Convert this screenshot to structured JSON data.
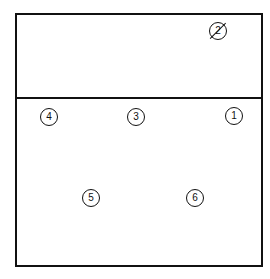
{
  "diagram": {
    "type": "volleyball-court-rotation",
    "line_color": "#111111",
    "background": "#ffffff",
    "court": {
      "left": 15,
      "top": 13,
      "right": 261,
      "bottom": 265
    },
    "divider_y": 98,
    "players": [
      {
        "id": "p1",
        "label": "1",
        "x": 234,
        "y": 116,
        "slashed": false
      },
      {
        "id": "p2",
        "label": "2",
        "x": 218,
        "y": 31,
        "slashed": true
      },
      {
        "id": "p3",
        "label": "3",
        "x": 136,
        "y": 117,
        "slashed": false
      },
      {
        "id": "p4",
        "label": "4",
        "x": 49,
        "y": 117,
        "slashed": false
      },
      {
        "id": "p5",
        "label": "5",
        "x": 91,
        "y": 198,
        "slashed": false
      },
      {
        "id": "p6",
        "label": "6",
        "x": 195,
        "y": 198,
        "slashed": false
      }
    ]
  }
}
